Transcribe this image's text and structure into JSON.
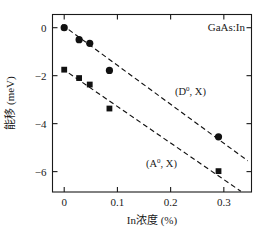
{
  "figure": {
    "annotation": "GaAs:In",
    "background_color": "#ffffff",
    "foreground_color": "#1a1a1a"
  },
  "chart_data": {
    "type": "scatter",
    "title": "",
    "subtitle": "",
    "xlabel": "In浓度 (%)",
    "ylabel": "能移 (meV)",
    "xlim": [
      -0.022,
      0.352
    ],
    "ylim": [
      -6.85,
      0.55
    ],
    "xticks": [
      0,
      0.1,
      0.2,
      0.3
    ],
    "xticklabels": [
      "0",
      "0.1",
      "0.2",
      "0.3"
    ],
    "yticks": [
      0,
      -2,
      -4,
      -6
    ],
    "yticklabels": [
      "0",
      "−2",
      "−4",
      "−6"
    ],
    "grid": false,
    "legend_position": "inline-annotations",
    "annotations": [
      {
        "text": "GaAs:In",
        "x": 0.285,
        "y": 0.18
      },
      {
        "text": "(D0, X)",
        "x": 0.175,
        "y": -2.55
      },
      {
        "text": "(A0, X)",
        "x": 0.135,
        "y": -5.05
      }
    ],
    "series": [
      {
        "name": "(D0, X)",
        "label_html": "(D<sup>0</sup>, X)",
        "marker": "circle",
        "color": "#111111",
        "x": [
          0.0,
          0.028,
          0.048,
          0.085,
          0.29
        ],
        "y": [
          0.0,
          -0.5,
          -0.65,
          -1.78,
          -4.55
        ],
        "fit_line": {
          "style": "dashed",
          "x": [
            -0.004,
            0.345
          ],
          "y": [
            0.12,
            -5.55
          ]
        }
      },
      {
        "name": "(A0, X)",
        "label_html": "(A<sup>0</sup>, X)",
        "marker": "square",
        "color": "#111111",
        "x": [
          0.0,
          0.028,
          0.048,
          0.085,
          0.29
        ],
        "y": [
          -1.75,
          -2.1,
          -2.37,
          -3.37,
          -5.98
        ],
        "fit_line": {
          "style": "dashed",
          "x": [
            -0.004,
            0.332
          ],
          "y": [
            -1.7,
            -6.82
          ]
        }
      }
    ]
  }
}
